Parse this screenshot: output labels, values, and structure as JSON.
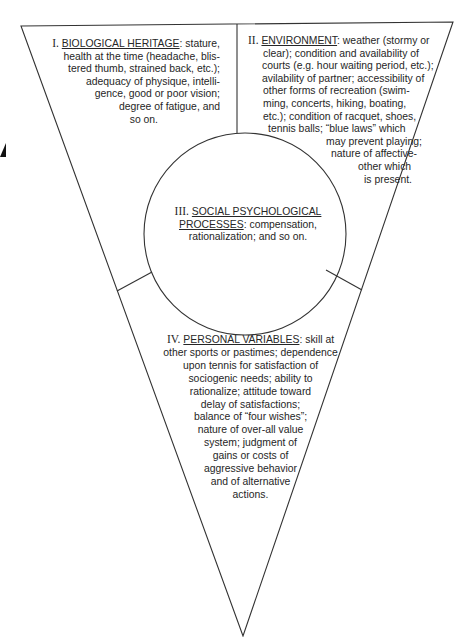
{
  "diagram": {
    "type": "inverted-triangle-with-center-circle",
    "line_color": "#333333",
    "sections": [
      {
        "id": "I",
        "numeral": "I.",
        "heading": "BIOLOGICAL HERITAGE",
        "lines": [
          ": stature,",
          "health at the time (headache, blis-",
          "tered thumb, strained back, etc.);",
          "adequacy of physique, intelli-",
          "gence, good or poor vision;",
          "degree of fatigue, and",
          "so on."
        ]
      },
      {
        "id": "II",
        "numeral": "II.",
        "heading": "ENVIRONMENT",
        "lines": [
          ": weather (stormy or",
          "clear); condition and availability of",
          "courts (e.g. hour waiting period, etc.);",
          "avilability of partner; accessibility of",
          "other forms of recreation (swim-",
          "ming, concerts, hiking, boating,",
          "etc.); condition of racquet, shoes,",
          "tennis balls; “blue laws” which",
          "may prevent playing;",
          "nature of affective-",
          "other which",
          "is present."
        ]
      },
      {
        "id": "III",
        "numeral": "III.",
        "heading_line1": "SOCIAL PSYCHOLOGICAL",
        "heading_line2": "PROCESSES",
        "lines": [
          ": compensation,",
          "rationalization; and so on."
        ]
      },
      {
        "id": "IV",
        "numeral": "IV.",
        "heading": "PERSONAL VARIABLES",
        "lines": [
          ": skill at",
          "other sports or pastimes; dependence",
          "upon tennis for satisfaction of",
          "sociogenic needs; ability to",
          "rationalize; attitude toward",
          "delay of satisfactions;",
          "balance of “four wishes”;",
          "nature of over-all value",
          "system; judgment of",
          "gains or costs of",
          "aggressive behavior",
          "and of alternative",
          "actions."
        ]
      }
    ]
  }
}
